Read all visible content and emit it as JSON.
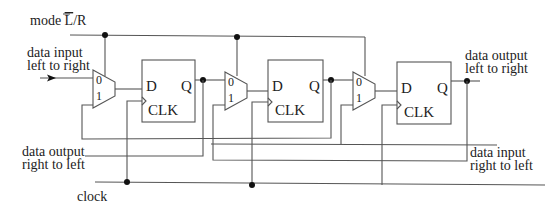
{
  "diagram": {
    "labels": {
      "mode": "mode L/R",
      "mode_prefix": "mode ",
      "mode_overbar_letter": "L",
      "mode_suffix": "/R",
      "data_input_lr_line1": "data input",
      "data_input_lr_line2": "left to right",
      "data_output_lr_line1": "data output",
      "data_output_lr_line2": "left to right",
      "data_output_rl_line1": "data output",
      "data_output_rl_line2": "right to left",
      "data_input_rl_line1": "data input",
      "data_input_rl_line2": "right to left",
      "clock": "clock"
    },
    "flip_flops": [
      {
        "d": "D",
        "q": "Q",
        "clk": "CLK"
      },
      {
        "d": "D",
        "q": "Q",
        "clk": "CLK"
      },
      {
        "d": "D",
        "q": "Q",
        "clk": "CLK"
      }
    ],
    "muxes": [
      {
        "in0": "0",
        "in1": "1"
      },
      {
        "in0": "0",
        "in1": "1"
      },
      {
        "in0": "0",
        "in1": "1"
      }
    ],
    "colors": {
      "wire": "#555555",
      "junction": "#111111",
      "text": "#222222",
      "background": "#ffffff"
    }
  }
}
